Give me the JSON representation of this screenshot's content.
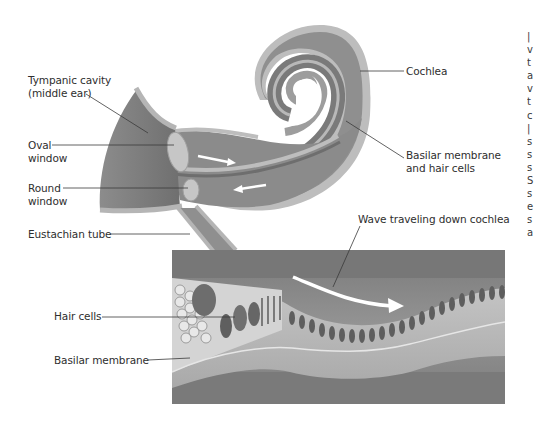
{
  "figure": {
    "labels": {
      "tympanic_cavity_line1": "Tympanic cavity",
      "tympanic_cavity_line2": "(middle ear)",
      "oval_window_line1": "Oval",
      "oval_window_line2": "window",
      "round_window_line1": "Round",
      "round_window_line2": "window",
      "eustachian_tube": "Eustachian tube",
      "cochlea": "Cochlea",
      "basilar_membrane_hair_cells_line1": "Basilar membrane",
      "basilar_membrane_hair_cells_line2": "and hair cells",
      "wave": "Wave traveling down cochlea",
      "hair_cells": "Hair cells",
      "basilar_membrane": "Basilar membrane"
    },
    "clipped_edge_text": [
      "|",
      "v",
      "t",
      "a",
      "v",
      "t",
      "c",
      "|",
      "s",
      "s",
      "s",
      "S",
      "s",
      "e",
      "s",
      "a"
    ],
    "colors": {
      "background": "#ffffff",
      "tissue_dark": "#7d7d7d",
      "tissue_mid": "#9a9a9a",
      "tissue_light": "#bdbdbd",
      "membrane_light": "#c9c9c9",
      "panel_bg": "#8a8a8a",
      "leader_line": "#3a3a3a",
      "arrow": "#ffffff",
      "text": "#2e2e2e"
    }
  }
}
